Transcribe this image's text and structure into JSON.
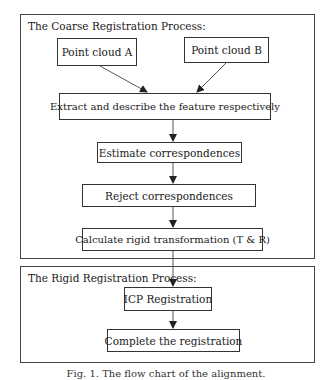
{
  "diagram": {
    "type": "flowchart",
    "groups": [
      {
        "id": "coarse",
        "title": "The Coarse Registration Process:"
      },
      {
        "id": "rigid",
        "title": "The Rigid Registration Process:"
      }
    ],
    "nodes": [
      {
        "id": "pcA",
        "group": "coarse",
        "label": "Point cloud A"
      },
      {
        "id": "pcB",
        "group": "coarse",
        "label": "Point cloud B"
      },
      {
        "id": "extract",
        "group": "coarse",
        "label": "Extract and describe the feature respectively"
      },
      {
        "id": "estimate",
        "group": "coarse",
        "label": "Estimate correspondences"
      },
      {
        "id": "reject",
        "group": "coarse",
        "label": "Reject correspondences"
      },
      {
        "id": "calc",
        "group": "coarse",
        "label": "Calculate rigid transformation (T & R)"
      },
      {
        "id": "icp",
        "group": "rigid",
        "label": "ICP Registration"
      },
      {
        "id": "complete",
        "group": "rigid",
        "label": "Complete the registration"
      }
    ],
    "edges": [
      {
        "from": "pcA",
        "to": "extract"
      },
      {
        "from": "pcB",
        "to": "extract"
      },
      {
        "from": "extract",
        "to": "estimate"
      },
      {
        "from": "estimate",
        "to": "reject"
      },
      {
        "from": "reject",
        "to": "calc"
      },
      {
        "from": "calc",
        "to": "icp"
      },
      {
        "from": "icp",
        "to": "complete"
      }
    ],
    "caption": "Fig. 1. The flow chart of the alignment."
  },
  "colors": {
    "line": "#333333",
    "background": "#ffffff",
    "text": "#1a1a1a"
  }
}
